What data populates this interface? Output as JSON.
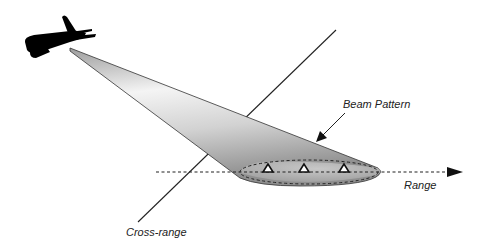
{
  "diagram": {
    "type": "sar-geometry-illustration",
    "labels": {
      "beam_pattern": "Beam Pattern",
      "range": "Range",
      "cross_range": "Cross-range"
    },
    "elements": {
      "aircraft": "aircraft silhouette (black)",
      "beam": "conical antenna beam (gray gradient)",
      "footprint": "dashed elliptical ground footprint",
      "targets": 3,
      "range_axis": "dashed arrow",
      "cross_range_axis": "solid line"
    },
    "colors": {
      "background": "#ffffff",
      "aircraft": "#000000",
      "beam_light": "#f2f2f2",
      "beam_dark": "#9a9a9a",
      "lines": "#222222"
    }
  }
}
